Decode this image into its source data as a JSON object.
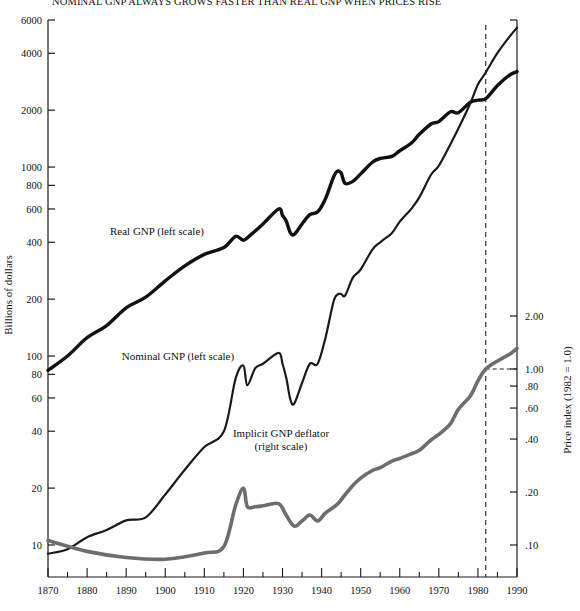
{
  "title": "NOMINAL GNP ALWAYS GROWS FASTER THAN REAL GNP WHEN PRICES RISE",
  "axes": {
    "left_title": "Billions of dollars",
    "right_title": "Price index (1982 = 1.0)",
    "left_ticks": [
      "6000",
      "4000",
      "2000",
      "1000",
      "800",
      "600",
      "400",
      "200",
      "100",
      "80",
      "60",
      "40",
      "20",
      "10"
    ],
    "right_ticks": [
      "2.00",
      "1.00",
      ".80",
      ".60",
      ".40",
      ".20",
      ".10"
    ],
    "x_ticks": [
      "1870",
      "1880",
      "1890",
      "1900",
      "1910",
      "1920",
      "1930",
      "1940",
      "1950",
      "1960",
      "1970",
      "1980",
      "1990"
    ]
  },
  "series_labels": {
    "real": "Real GNP (left scale)",
    "nominal": "Nominal GNP (left scale)",
    "deflator_line1": "Implicit GNP deflator",
    "deflator_line2": "(right scale)"
  },
  "colors": {
    "real": "#111111",
    "nominal": "#1a1a1a",
    "deflator": "#6d6d6d",
    "axis": "#1a1a1a",
    "marker_line": "#222222"
  },
  "marker": {
    "year": 1982,
    "style": "dashed-vertical"
  },
  "chart_data": {
    "type": "line",
    "title": "NOMINAL GNP ALWAYS GROWS FASTER THAN REAL GNP WHEN PRICES RISE",
    "xlabel": "",
    "ylabel": "Billions of dollars",
    "y2label": "Price index (1982 = 1.0)",
    "xlim": [
      1870,
      1990
    ],
    "ylim": [
      9,
      6000
    ],
    "y2lim": [
      0.09,
      2.6
    ],
    "yscale": "log",
    "y2scale": "log",
    "grid": false,
    "legend": "inline-annotations",
    "annotations": [
      {
        "text": "Real GNP (left scale)",
        "x": 1897,
        "y": 430
      },
      {
        "text": "Nominal GNP (left scale)",
        "x": 1902,
        "y": 83
      },
      {
        "text": "Implicit GNP deflator (right scale)",
        "x": 1936,
        "y2": 0.33
      }
    ],
    "reference_lines": [
      {
        "axis": "x",
        "value": 1982,
        "style": "dashed"
      }
    ],
    "series": [
      {
        "name": "Real GNP (left scale)",
        "axis": "left",
        "units": "Billions of 1982 dollars",
        "x": [
          1870,
          1875,
          1880,
          1885,
          1890,
          1895,
          1900,
          1905,
          1910,
          1915,
          1918,
          1920,
          1922,
          1925,
          1929,
          1930,
          1931,
          1932,
          1933,
          1935,
          1937,
          1939,
          1941,
          1943,
          1944,
          1945,
          1946,
          1948,
          1950,
          1953,
          1955,
          1958,
          1960,
          1963,
          1965,
          1968,
          1970,
          1973,
          1975,
          1978,
          1980,
          1982,
          1985,
          1988,
          1990
        ],
        "values": [
          84,
          100,
          125,
          145,
          180,
          205,
          250,
          300,
          345,
          375,
          430,
          410,
          440,
          500,
          600,
          555,
          515,
          450,
          440,
          500,
          560,
          580,
          680,
          880,
          950,
          930,
          820,
          840,
          920,
          1060,
          1110,
          1140,
          1220,
          1340,
          1490,
          1690,
          1740,
          1960,
          1940,
          2200,
          2260,
          2300,
          2700,
          3060,
          3200
        ]
      },
      {
        "name": "Nominal GNP (left scale)",
        "axis": "left",
        "units": "Billions of current dollars",
        "x": [
          1870,
          1875,
          1880,
          1885,
          1890,
          1895,
          1900,
          1905,
          1910,
          1915,
          1918,
          1920,
          1921,
          1923,
          1925,
          1929,
          1930,
          1931,
          1932,
          1933,
          1935,
          1937,
          1939,
          1941,
          1943,
          1944,
          1945,
          1946,
          1948,
          1950,
          1953,
          1955,
          1958,
          1960,
          1963,
          1965,
          1968,
          1970,
          1973,
          1975,
          1978,
          1980,
          1982,
          1985,
          1988,
          1990
        ],
        "values": [
          9,
          9.5,
          11,
          12,
          13.5,
          14,
          18.5,
          25,
          33,
          40,
          76,
          89,
          70,
          86,
          91,
          104,
          91,
          76,
          59,
          56,
          72,
          91,
          91,
          125,
          192,
          211,
          213,
          209,
          260,
          287,
          366,
          400,
          448,
          514,
          603,
          691,
          910,
          1016,
          1326,
          1598,
          2164,
          2732,
          3166,
          4015,
          4874,
          5460
        ]
      },
      {
        "name": "Implicit GNP deflator (right scale)",
        "axis": "right",
        "units": "Index, 1982 = 1.0",
        "x": [
          1870,
          1880,
          1890,
          1900,
          1910,
          1915,
          1918,
          1920,
          1921,
          1923,
          1925,
          1929,
          1931,
          1933,
          1935,
          1937,
          1939,
          1941,
          1944,
          1946,
          1948,
          1950,
          1953,
          1955,
          1958,
          1960,
          1963,
          1965,
          1968,
          1970,
          1973,
          1975,
          1978,
          1980,
          1982,
          1985,
          1988,
          1990
        ],
        "values": [
          0.106,
          0.092,
          0.085,
          0.083,
          0.09,
          0.098,
          0.168,
          0.21,
          0.165,
          0.165,
          0.167,
          0.172,
          0.147,
          0.128,
          0.137,
          0.148,
          0.137,
          0.152,
          0.17,
          0.193,
          0.218,
          0.24,
          0.265,
          0.275,
          0.3,
          0.31,
          0.33,
          0.345,
          0.395,
          0.425,
          0.49,
          0.59,
          0.7,
          0.855,
          1.0,
          1.11,
          1.21,
          1.31
        ]
      }
    ]
  }
}
